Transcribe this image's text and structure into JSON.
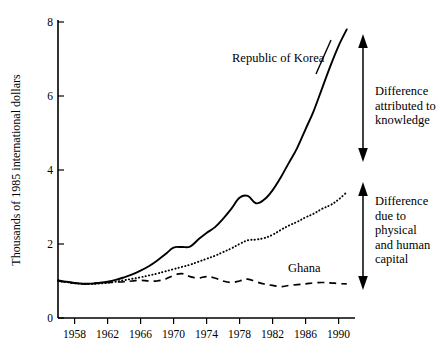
{
  "chart_data": {
    "type": "line",
    "title": "",
    "subtitle": "",
    "xlabel": "",
    "ylabel": "Thousands of 1985 international dollars",
    "xlim": [
      1956,
      1992
    ],
    "ylim": [
      0,
      8
    ],
    "grid": false,
    "legend_position": "inline-labels",
    "y_ticks": [
      "0",
      "2",
      "4",
      "6",
      "8"
    ],
    "y_tick_values": [
      0,
      2,
      4,
      6,
      8
    ],
    "x_ticks": [
      "1958",
      "1962",
      "1966",
      "1970",
      "1974",
      "1978",
      "1982",
      "1986",
      "1990"
    ],
    "x_tick_values": [
      1958,
      1962,
      1966,
      1970,
      1974,
      1978,
      1982,
      1986,
      1990
    ],
    "x": [
      1956,
      1957,
      1958,
      1959,
      1960,
      1961,
      1962,
      1963,
      1964,
      1965,
      1966,
      1967,
      1968,
      1969,
      1970,
      1971,
      1972,
      1973,
      1974,
      1975,
      1976,
      1977,
      1978,
      1979,
      1980,
      1981,
      1982,
      1983,
      1984,
      1985,
      1986,
      1987,
      1988,
      1989,
      1990,
      1991
    ],
    "series": [
      {
        "name": "Republic of Korea",
        "style": "solid",
        "values": [
          1.02,
          0.98,
          0.95,
          0.93,
          0.93,
          0.95,
          0.98,
          1.03,
          1.1,
          1.18,
          1.28,
          1.4,
          1.55,
          1.72,
          1.9,
          1.92,
          1.93,
          2.12,
          2.3,
          2.45,
          2.68,
          2.95,
          3.25,
          3.3,
          3.1,
          3.2,
          3.45,
          3.8,
          4.2,
          4.6,
          5.1,
          5.6,
          6.2,
          6.8,
          7.35,
          7.8
        ]
      },
      {
        "name": "Difference due to physical and human capital boundary",
        "style": "dotted",
        "values": [
          1.0,
          0.97,
          0.94,
          0.92,
          0.92,
          0.93,
          0.95,
          0.98,
          1.02,
          1.06,
          1.1,
          1.15,
          1.2,
          1.26,
          1.32,
          1.38,
          1.44,
          1.52,
          1.6,
          1.68,
          1.78,
          1.88,
          2.0,
          2.1,
          2.12,
          2.16,
          2.25,
          2.38,
          2.5,
          2.6,
          2.72,
          2.82,
          2.95,
          3.05,
          3.2,
          3.4
        ]
      },
      {
        "name": "Ghana",
        "style": "dashed",
        "values": [
          1.0,
          0.97,
          0.94,
          0.92,
          0.93,
          0.95,
          0.96,
          0.97,
          0.98,
          1.0,
          1.02,
          1.0,
          1.0,
          1.05,
          1.15,
          1.2,
          1.12,
          1.08,
          1.12,
          1.08,
          1.0,
          0.96,
          1.0,
          1.05,
          0.98,
          0.92,
          0.88,
          0.85,
          0.88,
          0.9,
          0.92,
          0.95,
          0.96,
          0.95,
          0.93,
          0.92
        ]
      }
    ],
    "annotations": [
      {
        "id": "korea-label",
        "text": "Republic of Korea"
      },
      {
        "id": "ghana-label",
        "text": "Ghana"
      },
      {
        "id": "knowledge-bracket",
        "text": "Difference\nattributed to\nknowledge"
      },
      {
        "id": "capital-bracket",
        "text": "Difference\ndue to\nphysical\nand human\ncapital"
      }
    ],
    "colors": {
      "line": "#000000",
      "background": "#ffffff",
      "text": "#000000"
    }
  }
}
